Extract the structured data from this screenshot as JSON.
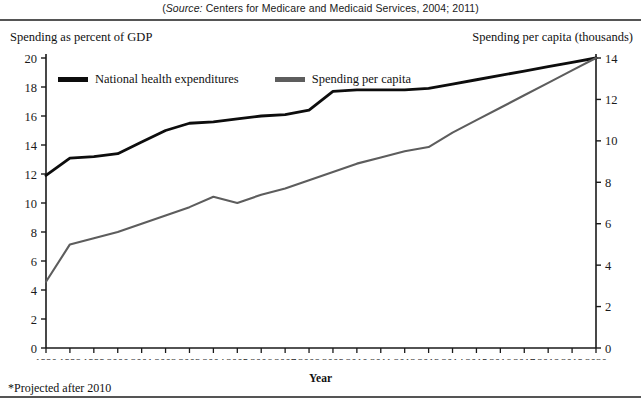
{
  "source_note": {
    "italic_prefix": "Source:",
    "rest": " Centers for Medicare and Medicaid Services, 2004; 2011)",
    "open_paren": "("
  },
  "left_axis_title": "Spending as percent of GDP",
  "right_axis_title": "Spending per capita (thousands)",
  "xaxis_title": "Year",
  "footnote": "*Projected after 2010",
  "legend": {
    "series1_label": "National health expenditures",
    "series2_label": "Spending per capita",
    "series1_color": "#0d0d0d",
    "series2_color": "#5d5d5d"
  },
  "chart_data": {
    "type": "line",
    "title": "",
    "xlabel": "Year",
    "ylabel": "Spending as percent of GDP",
    "y2label": "Spending per capita (thousands)",
    "grid": false,
    "legend_position": "top-left-inside",
    "ylim": [
      0,
      20
    ],
    "y2lim": [
      0,
      14
    ],
    "yticks": [
      0,
      2,
      4,
      6,
      8,
      10,
      12,
      14,
      16,
      18,
      20
    ],
    "y2ticks": [
      0,
      2,
      4,
      6,
      8,
      10,
      12,
      14
    ],
    "categories": [
      "1990",
      "1998",
      "1999",
      "2000",
      "2001",
      "2002",
      "2003",
      "2004",
      "2005",
      "2006",
      "2007",
      "2008",
      "2009",
      "2010",
      "2011",
      "2012",
      "2013",
      "2014",
      "2015",
      "2016",
      "2017",
      "2018",
      "2019",
      "2020"
    ],
    "series": [
      {
        "name": "National health expenditures",
        "axis": "left",
        "color": "#0d0d0d",
        "values": [
          11.9,
          13.1,
          13.2,
          13.4,
          14.2,
          15.0,
          15.5,
          15.6,
          15.8,
          16.0,
          16.1,
          16.4,
          17.7,
          17.8,
          17.8,
          17.8,
          17.9,
          18.2,
          18.5,
          18.8,
          19.1,
          19.4,
          19.7,
          20.0
        ]
      },
      {
        "name": "Spending per capita",
        "axis": "right",
        "color": "#5d5d5d",
        "values": [
          3.2,
          5.0,
          5.3,
          5.6,
          6.0,
          6.4,
          6.8,
          7.3,
          7.0,
          7.4,
          7.7,
          8.1,
          8.5,
          8.9,
          9.2,
          9.5,
          9.7,
          10.4,
          11.0,
          11.6,
          12.2,
          12.8,
          13.4,
          14.0
        ]
      }
    ],
    "annotations": [
      "*Projected after 2010"
    ]
  }
}
